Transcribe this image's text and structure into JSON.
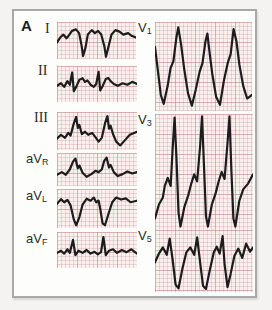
{
  "figure": {
    "panel_label": "A"
  },
  "colors": {
    "page_background": "#f4f3f1",
    "frame_background": "#fdfdfc",
    "frame_border": "#a8a8a6",
    "grid_paper": "#f9f1ef",
    "grid_line_major": "#c68c8c",
    "grid_line_minor": "#d7afaf",
    "trace": "#1c1c1c",
    "label_text": "#2a2a2a"
  },
  "chart_data": {
    "type": "line",
    "x_unit": "time (normalized 0-100 per strip)",
    "y_unit": "amplitude (normalized 0-100 per strip, 0 = top)",
    "grid": "on",
    "leads": [
      {
        "id": "I",
        "label": "I",
        "sub": "",
        "serif": true,
        "x": 57,
        "y": 22,
        "w": 79,
        "h": 37,
        "label_x": 45,
        "label_y": 21,
        "points": [
          [
            0,
            55
          ],
          [
            4,
            42
          ],
          [
            8,
            34
          ],
          [
            12,
            44
          ],
          [
            15,
            36
          ],
          [
            19,
            24
          ],
          [
            24,
            20
          ],
          [
            28,
            30
          ],
          [
            31,
            62
          ],
          [
            33,
            92
          ],
          [
            36,
            70
          ],
          [
            39,
            34
          ],
          [
            44,
            22
          ],
          [
            48,
            30
          ],
          [
            52,
            24
          ],
          [
            56,
            34
          ],
          [
            60,
            66
          ],
          [
            62,
            94
          ],
          [
            65,
            68
          ],
          [
            69,
            34
          ],
          [
            74,
            22
          ],
          [
            79,
            26
          ],
          [
            84,
            34
          ],
          [
            90,
            30
          ],
          [
            95,
            38
          ],
          [
            100,
            42
          ]
        ]
      },
      {
        "id": "II",
        "label": "II",
        "sub": "",
        "serif": true,
        "x": 57,
        "y": 66,
        "w": 80,
        "h": 36,
        "label_x": 38,
        "label_y": 63,
        "points": [
          [
            0,
            55
          ],
          [
            5,
            48
          ],
          [
            9,
            58
          ],
          [
            13,
            42
          ],
          [
            16,
            52
          ],
          [
            19,
            18
          ],
          [
            21,
            70
          ],
          [
            24,
            58
          ],
          [
            28,
            38
          ],
          [
            32,
            34
          ],
          [
            35,
            44
          ],
          [
            38,
            40
          ],
          [
            42,
            52
          ],
          [
            46,
            58
          ],
          [
            49,
            50
          ],
          [
            52,
            16
          ],
          [
            54,
            68
          ],
          [
            57,
            56
          ],
          [
            61,
            36
          ],
          [
            64,
            33
          ],
          [
            67,
            42
          ],
          [
            71,
            50
          ],
          [
            76,
            55
          ],
          [
            82,
            48
          ],
          [
            88,
            52
          ],
          [
            94,
            44
          ],
          [
            100,
            50
          ]
        ]
      },
      {
        "id": "III",
        "label": "III",
        "sub": "",
        "serif": true,
        "x": 57,
        "y": 112,
        "w": 80,
        "h": 38,
        "label_x": 34,
        "label_y": 110,
        "points": [
          [
            0,
            70
          ],
          [
            5,
            60
          ],
          [
            10,
            68
          ],
          [
            14,
            55
          ],
          [
            17,
            62
          ],
          [
            21,
            30
          ],
          [
            24,
            13
          ],
          [
            26,
            42
          ],
          [
            28,
            34
          ],
          [
            31,
            58
          ],
          [
            35,
            52
          ],
          [
            39,
            60
          ],
          [
            44,
            55
          ],
          [
            48,
            66
          ],
          [
            52,
            78
          ],
          [
            56,
            68
          ],
          [
            60,
            30
          ],
          [
            63,
            11
          ],
          [
            65,
            44
          ],
          [
            67,
            36
          ],
          [
            70,
            58
          ],
          [
            74,
            78
          ],
          [
            79,
            88
          ],
          [
            85,
            74
          ],
          [
            91,
            60
          ],
          [
            100,
            52
          ]
        ]
      },
      {
        "id": "aVR",
        "label": "aV",
        "sub": "R",
        "serif": false,
        "x": 57,
        "y": 153,
        "w": 80,
        "h": 33,
        "label_x": 26,
        "label_y": 151,
        "points": [
          [
            0,
            66
          ],
          [
            6,
            58
          ],
          [
            11,
            66
          ],
          [
            16,
            50
          ],
          [
            20,
            26
          ],
          [
            23,
            17
          ],
          [
            26,
            46
          ],
          [
            28,
            38
          ],
          [
            32,
            60
          ],
          [
            37,
            72
          ],
          [
            43,
            64
          ],
          [
            48,
            54
          ],
          [
            52,
            58
          ],
          [
            56,
            50
          ],
          [
            59,
            24
          ],
          [
            62,
            14
          ],
          [
            65,
            44
          ],
          [
            67,
            36
          ],
          [
            71,
            58
          ],
          [
            76,
            70
          ],
          [
            82,
            64
          ],
          [
            88,
            56
          ],
          [
            94,
            62
          ],
          [
            100,
            58
          ]
        ]
      },
      {
        "id": "aVL",
        "label": "aV",
        "sub": "L",
        "serif": false,
        "x": 57,
        "y": 189,
        "w": 80,
        "h": 39,
        "label_x": 26,
        "label_y": 188,
        "points": [
          [
            0,
            38
          ],
          [
            5,
            26
          ],
          [
            9,
            34
          ],
          [
            13,
            28
          ],
          [
            17,
            42
          ],
          [
            21,
            78
          ],
          [
            24,
            93
          ],
          [
            28,
            72
          ],
          [
            32,
            40
          ],
          [
            37,
            25
          ],
          [
            42,
            30
          ],
          [
            46,
            22
          ],
          [
            49,
            34
          ],
          [
            52,
            30
          ],
          [
            54,
            50
          ],
          [
            57,
            88
          ],
          [
            60,
            93
          ],
          [
            64,
            66
          ],
          [
            69,
            34
          ],
          [
            74,
            22
          ],
          [
            80,
            27
          ],
          [
            86,
            24
          ],
          [
            92,
            34
          ],
          [
            100,
            30
          ]
        ]
      },
      {
        "id": "aVF",
        "label": "aV",
        "sub": "F",
        "serif": false,
        "x": 57,
        "y": 232,
        "w": 80,
        "h": 36,
        "label_x": 26,
        "label_y": 231,
        "points": [
          [
            0,
            58
          ],
          [
            5,
            52
          ],
          [
            9,
            60
          ],
          [
            13,
            48
          ],
          [
            16,
            58
          ],
          [
            20,
            22
          ],
          [
            23,
            64
          ],
          [
            27,
            52
          ],
          [
            32,
            58
          ],
          [
            37,
            50
          ],
          [
            42,
            60
          ],
          [
            47,
            55
          ],
          [
            51,
            62
          ],
          [
            55,
            56
          ],
          [
            58,
            14
          ],
          [
            61,
            64
          ],
          [
            65,
            52
          ],
          [
            70,
            48
          ],
          [
            75,
            58
          ],
          [
            81,
            50
          ],
          [
            87,
            56
          ],
          [
            93,
            48
          ],
          [
            100,
            60
          ]
        ]
      },
      {
        "id": "V1",
        "label": "V",
        "sub": "1",
        "serif": false,
        "x": 155,
        "y": 22,
        "w": 97,
        "h": 89,
        "label_x": 138,
        "label_y": 20,
        "points": [
          [
            0,
            28
          ],
          [
            3,
            55
          ],
          [
            6,
            82
          ],
          [
            9,
            92
          ],
          [
            13,
            72
          ],
          [
            16,
            52
          ],
          [
            19,
            44
          ],
          [
            22,
            18
          ],
          [
            24,
            6
          ],
          [
            27,
            26
          ],
          [
            30,
            52
          ],
          [
            34,
            80
          ],
          [
            38,
            94
          ],
          [
            42,
            76
          ],
          [
            46,
            56
          ],
          [
            49,
            46
          ],
          [
            52,
            22
          ],
          [
            54,
            13
          ],
          [
            56,
            32
          ],
          [
            59,
            58
          ],
          [
            63,
            84
          ],
          [
            67,
            93
          ],
          [
            71,
            66
          ],
          [
            75,
            46
          ],
          [
            78,
            36
          ],
          [
            81,
            8
          ],
          [
            84,
            22
          ],
          [
            87,
            48
          ],
          [
            91,
            72
          ],
          [
            95,
            86
          ],
          [
            100,
            82
          ]
        ]
      },
      {
        "id": "V3",
        "label": "V",
        "sub": "3",
        "serif": false,
        "x": 155,
        "y": 114,
        "w": 98,
        "h": 116,
        "label_x": 138,
        "label_y": 112,
        "points": [
          [
            0,
            90
          ],
          [
            4,
            78
          ],
          [
            8,
            72
          ],
          [
            10,
            62
          ],
          [
            13,
            55
          ],
          [
            16,
            62
          ],
          [
            18,
            30
          ],
          [
            20,
            3
          ],
          [
            22,
            40
          ],
          [
            24,
            85
          ],
          [
            26,
            97
          ],
          [
            30,
            80
          ],
          [
            34,
            70
          ],
          [
            37,
            60
          ],
          [
            40,
            52
          ],
          [
            43,
            58
          ],
          [
            46,
            28
          ],
          [
            48,
            2
          ],
          [
            50,
            45
          ],
          [
            52,
            88
          ],
          [
            54,
            97
          ],
          [
            58,
            78
          ],
          [
            62,
            68
          ],
          [
            65,
            58
          ],
          [
            68,
            50
          ],
          [
            71,
            56
          ],
          [
            74,
            25
          ],
          [
            76,
            2
          ],
          [
            78,
            50
          ],
          [
            80,
            90
          ],
          [
            82,
            97
          ],
          [
            86,
            75
          ],
          [
            90,
            65
          ],
          [
            95,
            60
          ],
          [
            100,
            52
          ]
        ]
      },
      {
        "id": "V5",
        "label": "V",
        "sub": "5",
        "serif": false,
        "x": 155,
        "y": 230,
        "w": 98,
        "h": 62,
        "label_x": 138,
        "label_y": 228,
        "points": [
          [
            0,
            52
          ],
          [
            4,
            38
          ],
          [
            8,
            28
          ],
          [
            12,
            40
          ],
          [
            15,
            14
          ],
          [
            18,
            48
          ],
          [
            21,
            88
          ],
          [
            24,
            94
          ],
          [
            28,
            62
          ],
          [
            32,
            36
          ],
          [
            36,
            28
          ],
          [
            40,
            40
          ],
          [
            43,
            12
          ],
          [
            46,
            52
          ],
          [
            49,
            90
          ],
          [
            52,
            95
          ],
          [
            56,
            64
          ],
          [
            60,
            36
          ],
          [
            63,
            27
          ],
          [
            66,
            38
          ],
          [
            69,
            10
          ],
          [
            71,
            55
          ],
          [
            74,
            92
          ],
          [
            77,
            72
          ],
          [
            81,
            42
          ],
          [
            85,
            30
          ],
          [
            89,
            45
          ],
          [
            93,
            22
          ],
          [
            97,
            35
          ],
          [
            100,
            28
          ]
        ]
      }
    ]
  }
}
